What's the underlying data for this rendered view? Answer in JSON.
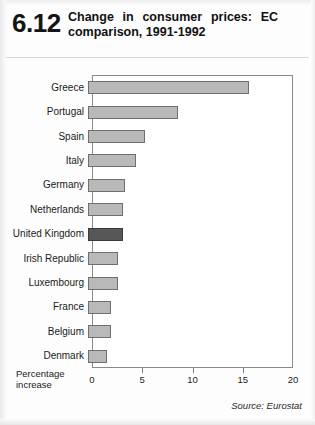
{
  "header": {
    "figure_number": "6.12",
    "title_line1": "Change in consumer prices: EC",
    "title_line2": "comparison, 1991-1992"
  },
  "axis": {
    "caption_line1": "Percentage",
    "caption_line2": "increase"
  },
  "footer": {
    "source": "Source: Eurostat"
  },
  "colors": {
    "bar": "#b9b9b9",
    "bar_highlight": "#575757",
    "bar_border": "#6f6f6f",
    "frame": "#8a8a8a"
  },
  "chart_data": {
    "type": "bar",
    "orientation": "horizontal",
    "title": "Change in consumer prices: EC comparison, 1991-1992",
    "xlabel": "Percentage increase",
    "ylabel": "",
    "xlim": [
      0,
      20
    ],
    "xticks": [
      0,
      5,
      10,
      15,
      20
    ],
    "xtick_labels": [
      "0",
      "5",
      "10",
      "15",
      "20"
    ],
    "grid": false,
    "legend": null,
    "highlight_category": "United Kingdom",
    "categories": [
      "Greece",
      "Portugal",
      "Spain",
      "Italy",
      "Germany",
      "Netherlands",
      "United Kingdom",
      "Irish Republic",
      "Luxembourg",
      "France",
      "Belgium",
      "Denmark"
    ],
    "values": [
      16.0,
      9.0,
      5.7,
      4.8,
      3.7,
      3.5,
      3.5,
      3.0,
      3.0,
      2.3,
      2.3,
      1.9
    ],
    "source": "Source: Eurostat"
  }
}
